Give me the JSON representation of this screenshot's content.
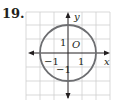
{
  "problem_number": "19.",
  "axes": {
    "x_label": "x",
    "y_label": "y",
    "origin_label": "O"
  },
  "tick_labels": {
    "x_pos": "1",
    "x_neg": "−1",
    "y_pos": "1",
    "y_neg": "−1"
  },
  "circle": {
    "center": [
      0,
      0
    ],
    "radius": 2,
    "color": "#6d6e71"
  },
  "grid": {
    "color": "#cfcfcf",
    "x_range": [
      -3,
      3
    ],
    "y_range": [
      -3,
      3
    ]
  }
}
